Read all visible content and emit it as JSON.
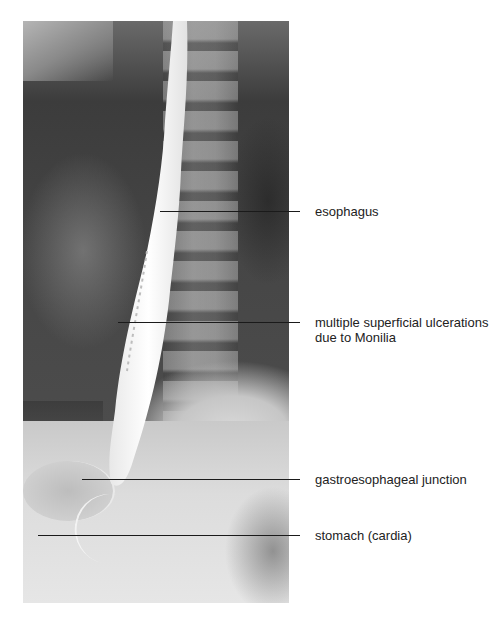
{
  "figure": {
    "type": "barium swallow radiograph",
    "background_color": "#ffffff",
    "line_color": "#1a1a1a",
    "text_color": "#222222"
  },
  "labels": [
    {
      "id": "esophagus",
      "text_lines": [
        "esophagus"
      ]
    },
    {
      "id": "ulcerations",
      "text_lines": [
        "multiple superficial ulcerations",
        "due to Monilia"
      ]
    },
    {
      "id": "ge-junction",
      "text_lines": [
        "gastroesophageal junction"
      ]
    },
    {
      "id": "stomach",
      "text_lines": [
        "stomach (cardia)"
      ]
    }
  ]
}
